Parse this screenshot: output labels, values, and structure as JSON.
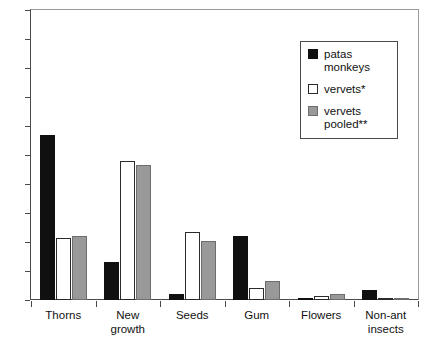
{
  "chart_data": {
    "type": "bar",
    "title": "",
    "xlabel": "",
    "ylabel": "",
    "ylim": [
      0,
      100
    ],
    "yticks": [
      0,
      10,
      20,
      30,
      40,
      50,
      60,
      70,
      80,
      90,
      100
    ],
    "grid": false,
    "legend_position": "top-right",
    "categories": [
      "Thorns",
      "New growth",
      "Seeds",
      "Gum",
      "Flowers",
      "Non-ant insects"
    ],
    "category_lines": [
      [
        "Thorns"
      ],
      [
        "New",
        "growth"
      ],
      [
        "Seeds"
      ],
      [
        "Gum"
      ],
      [
        "Flowers"
      ],
      [
        "Non-ant",
        "insects"
      ]
    ],
    "series": [
      {
        "name": "patas monkeys",
        "color": "#101010",
        "values": [
          57,
          13,
          2,
          22,
          0.7,
          3.5
        ]
      },
      {
        "name": "vervets*",
        "color": "#ffffff",
        "values": [
          21.5,
          48,
          23.5,
          4,
          1.5,
          0
        ]
      },
      {
        "name": "vervets pooled**",
        "color": "#999999",
        "values": [
          22,
          46.5,
          20.5,
          6.5,
          2,
          0.5
        ]
      }
    ]
  },
  "legend": {
    "entries": [
      {
        "label": "patas monkeys",
        "swatch": "black-filled-square"
      },
      {
        "label": "vervets*",
        "swatch": "white-square"
      },
      {
        "label": "vervets pooled**",
        "swatch": "gray-filled-square"
      }
    ]
  },
  "axes": {
    "y_tick_labels": [
      "100",
      "90",
      "80",
      "70",
      "60",
      "50",
      "40",
      "30",
      "20",
      "10",
      "0"
    ],
    "x_tick_labels": [
      "Thorns",
      "New growth",
      "Seeds",
      "Gum",
      "Flowers",
      "Non-ant insects"
    ]
  }
}
